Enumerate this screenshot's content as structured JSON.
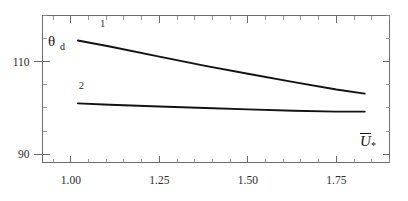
{
  "chart_data": {
    "type": "line",
    "title": "",
    "subtitle": "",
    "xlabel": "Ū*",
    "ylabel": "θd",
    "ylabel_base": "θ",
    "ylabel_sub": "d",
    "xlabel_base": "U",
    "xlabel_sub": "*",
    "xlim": [
      0.92,
      1.9
    ],
    "ylim": [
      88.2,
      120.0
    ],
    "grid": false,
    "legend_position": "inline-curve-labels",
    "x_ticks_major": [
      1.0,
      1.25,
      1.5,
      1.75
    ],
    "x_tick_labels": [
      "1.00",
      "1.25",
      "1.50",
      "1.75"
    ],
    "x_tick_minor_step": 0.05,
    "y_ticks_major": [
      90,
      110
    ],
    "y_tick_labels": [
      "90",
      "110"
    ],
    "y_tick_minor_step": 5,
    "series": [
      {
        "name": "1",
        "label": "1",
        "x": [
          1.02,
          1.11,
          1.25,
          1.38,
          1.5,
          1.63,
          1.75,
          1.83
        ],
        "values": [
          114.6,
          113.3,
          111.1,
          109.1,
          107.4,
          105.6,
          104.0,
          103.1
        ]
      },
      {
        "name": "2",
        "label": "2",
        "x": [
          1.02,
          1.11,
          1.25,
          1.38,
          1.5,
          1.63,
          1.75,
          1.83
        ],
        "values": [
          101.0,
          100.7,
          100.3,
          100.0,
          99.7,
          99.4,
          99.2,
          99.2
        ]
      }
    ],
    "series_label_positions": [
      {
        "name": "1",
        "x": 1.09,
        "y": 117.6
      },
      {
        "name": "2",
        "x": 1.03,
        "y": 104.0
      }
    ],
    "colors": {
      "curve": "#121212",
      "axis": "#6b6b6b",
      "text": "#1a1a1a",
      "background": "#ffffff"
    }
  }
}
